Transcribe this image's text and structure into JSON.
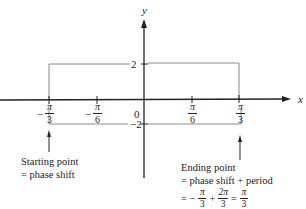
{
  "diagram": {
    "axes": {
      "x_label": "x",
      "y_label": "y",
      "origin_label": "0"
    },
    "y_ticks": [
      {
        "label": "2",
        "value": 2
      },
      {
        "label": "-2",
        "value": -2
      }
    ],
    "x_ticks": [
      {
        "sign": "−",
        "num": "π",
        "den": "3",
        "value": "-π/3"
      },
      {
        "sign": "−",
        "num": "π",
        "den": "6",
        "value": "-π/6"
      },
      {
        "sign": "",
        "num": "π",
        "den": "6",
        "value": "π/6"
      },
      {
        "sign": "",
        "num": "π",
        "den": "3",
        "value": "π/3"
      }
    ],
    "bounding_box": {
      "x_start": "-π/3",
      "x_end": "π/3",
      "y_top": 2,
      "y_bottom": -2
    },
    "annotations": {
      "start": {
        "line1": "Starting point",
        "line2": "= phase shift"
      },
      "end": {
        "line1": "Ending point",
        "line2": "= phase shift + period",
        "line3_prefix": "= −",
        "f1_num": "π",
        "f1_den": "3",
        "plus": "+",
        "f2_num": "2π",
        "f2_den": "3",
        "eq": "=",
        "f3_num": "π",
        "f3_den": "3"
      }
    },
    "colors": {
      "axis": "#222222",
      "box": "#8a8a8a",
      "text": "#222222"
    }
  }
}
